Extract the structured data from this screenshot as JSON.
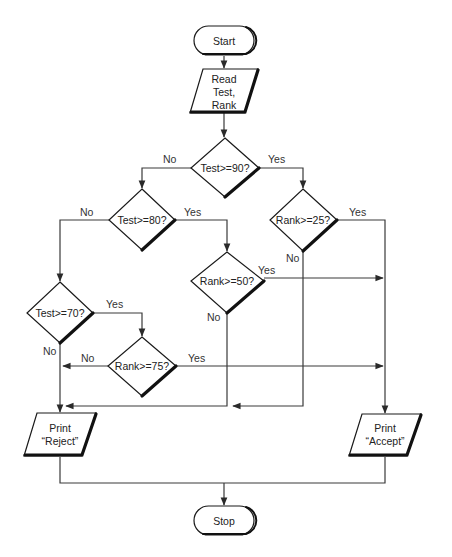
{
  "diagram": {
    "type": "flowchart",
    "nodes": {
      "start": {
        "label": "Start",
        "shape": "terminal"
      },
      "read": {
        "lines": [
          "Read",
          "Test,",
          "Rank"
        ],
        "shape": "input-output"
      },
      "d_test90": {
        "label": "Test>=90?",
        "shape": "decision"
      },
      "d_test80": {
        "label": "Test>=80?",
        "shape": "decision"
      },
      "d_rank25": {
        "label": "Rank>=25?",
        "shape": "decision"
      },
      "d_rank50": {
        "label": "Rank>=50?",
        "shape": "decision"
      },
      "d_test70": {
        "label": "Test>=70?",
        "shape": "decision"
      },
      "d_rank75": {
        "label": "Rank>=75?",
        "shape": "decision"
      },
      "reject": {
        "lines": [
          "Print",
          "“Reject”"
        ],
        "shape": "input-output"
      },
      "accept": {
        "lines": [
          "Print",
          "“Accept”"
        ],
        "shape": "input-output"
      },
      "stop": {
        "label": "Stop",
        "shape": "terminal"
      }
    },
    "edge_labels": {
      "test90_no": "No",
      "test90_yes": "Yes",
      "test80_no": "No",
      "test80_yes": "Yes",
      "rank25_yes": "Yes",
      "rank25_no": "No",
      "rank50_yes": "Yes",
      "rank50_no": "No",
      "test70_yes": "Yes",
      "test70_no": "No",
      "rank75_no": "No",
      "rank75_yes": "Yes"
    },
    "edges": [
      {
        "from": "start",
        "to": "read"
      },
      {
        "from": "read",
        "to": "d_test90"
      },
      {
        "from": "d_test90",
        "to": "d_test80",
        "label": "No"
      },
      {
        "from": "d_test90",
        "to": "d_rank25",
        "label": "Yes"
      },
      {
        "from": "d_test80",
        "to": "d_test70",
        "label": "No"
      },
      {
        "from": "d_test80",
        "to": "d_rank50",
        "label": "Yes"
      },
      {
        "from": "d_rank25",
        "to": "accept",
        "label": "Yes"
      },
      {
        "from": "d_rank25",
        "to": "reject",
        "label": "No"
      },
      {
        "from": "d_rank50",
        "to": "accept",
        "label": "Yes"
      },
      {
        "from": "d_rank50",
        "to": "reject",
        "label": "No"
      },
      {
        "from": "d_test70",
        "to": "d_rank75",
        "label": "Yes"
      },
      {
        "from": "d_test70",
        "to": "reject",
        "label": "No"
      },
      {
        "from": "d_rank75",
        "to": "reject",
        "label": "No"
      },
      {
        "from": "d_rank75",
        "to": "accept",
        "label": "Yes"
      },
      {
        "from": "reject",
        "to": "stop"
      },
      {
        "from": "accept",
        "to": "stop"
      }
    ]
  }
}
